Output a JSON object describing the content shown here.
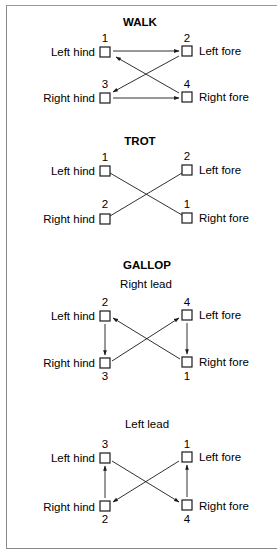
{
  "figure": {
    "sections": [
      {
        "id": "walk",
        "title": "WALK",
        "subtitle": "",
        "labels": {
          "lh": "Left hind",
          "lf": "Left fore",
          "rh": "Right hind",
          "rf": "Right fore"
        },
        "numbers": {
          "lh": "1",
          "lf": "2",
          "rh": "3",
          "rf": "4"
        },
        "number_position": "above",
        "connections": [
          {
            "from": "lh",
            "to": "lf",
            "arrow": true
          },
          {
            "from": "lf",
            "to": "rh",
            "arrow": true
          },
          {
            "from": "rh",
            "to": "rf",
            "arrow": true
          },
          {
            "from": "rf",
            "to": "lh",
            "arrow": true
          }
        ]
      },
      {
        "id": "trot",
        "title": "TROT",
        "subtitle": "",
        "labels": {
          "lh": "Left hind",
          "lf": "Left fore",
          "rh": "Right hind",
          "rf": "Right fore"
        },
        "numbers": {
          "lh": "1",
          "lf": "2",
          "rh": "2",
          "rf": "1"
        },
        "number_position": "above",
        "connections": [
          {
            "from": "lh",
            "to": "rf",
            "arrow": false
          },
          {
            "from": "rh",
            "to": "lf",
            "arrow": false
          }
        ]
      },
      {
        "id": "gallop-right",
        "title": "GALLOP",
        "subtitle": "Right lead",
        "labels": {
          "lh": "Left hind",
          "lf": "Left fore",
          "rh": "Right hind",
          "rf": "Right fore"
        },
        "numbers": {
          "lh": "2",
          "lf": "4",
          "rh": "3",
          "rf": "1"
        },
        "number_position": "top-above-bottom-below",
        "connections": [
          {
            "from": "rf",
            "to": "lh",
            "arrow": true
          },
          {
            "from": "lh",
            "to": "rh",
            "arrow": true
          },
          {
            "from": "rh",
            "to": "lf",
            "arrow": true
          },
          {
            "from": "lf",
            "to": "rf",
            "arrow": true
          }
        ]
      },
      {
        "id": "gallop-left",
        "title": "",
        "subtitle": "Left lead",
        "labels": {
          "lh": "Left hind",
          "lf": "Left fore",
          "rh": "Right hind",
          "rf": "Right fore"
        },
        "numbers": {
          "lh": "3",
          "lf": "1",
          "rh": "2",
          "rf": "4"
        },
        "number_position": "top-above-bottom-below",
        "connections": [
          {
            "from": "lf",
            "to": "rh",
            "arrow": true
          },
          {
            "from": "rh",
            "to": "lh",
            "arrow": true
          },
          {
            "from": "lh",
            "to": "rf",
            "arrow": true
          },
          {
            "from": "rf",
            "to": "lf",
            "arrow": true
          }
        ]
      }
    ]
  }
}
